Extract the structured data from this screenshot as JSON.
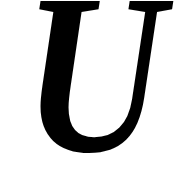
{
  "glyph": {
    "character": "U",
    "style": "italic serif",
    "color": "#000000",
    "background": "#ffffff"
  }
}
